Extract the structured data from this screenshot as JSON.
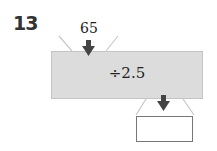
{
  "problem": {
    "number": "13",
    "input_value": "65",
    "operation": "÷2.5",
    "answer": ""
  },
  "colors": {
    "machine_fill": "#dcdcdc",
    "arrow": "#444444",
    "funnel_lines": "#c8c8c8"
  }
}
